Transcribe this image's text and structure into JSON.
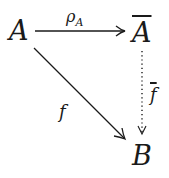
{
  "diagram": {
    "type": "commutative-diagram",
    "nodes": [
      {
        "id": "A",
        "label": "A"
      },
      {
        "id": "Abar",
        "label": "A",
        "overline": true
      },
      {
        "id": "B",
        "label": "B"
      }
    ],
    "edges": [
      {
        "from": "A",
        "to": "Abar",
        "label": "ρ",
        "label_sub": "A",
        "style": "solid"
      },
      {
        "from": "A",
        "to": "B",
        "label": "f",
        "style": "solid"
      },
      {
        "from": "Abar",
        "to": "B",
        "label": "f",
        "label_overline": true,
        "style": "dotted"
      }
    ]
  }
}
